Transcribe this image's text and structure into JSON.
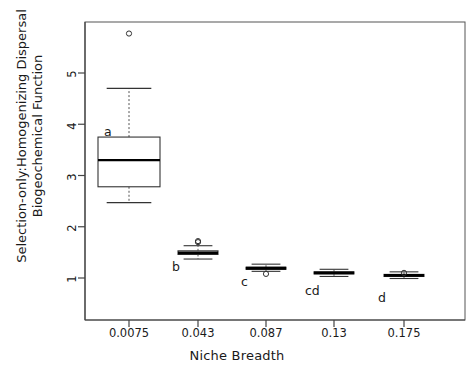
{
  "chart_data": {
    "type": "box",
    "title": "",
    "xlabel": "Niche Breadth",
    "ylabel_line1": "Selection-only:Homogenizing Dispersal",
    "ylabel_line2": "Biogeochemical Function",
    "categories": [
      "0.0075",
      "0.043",
      "0.087",
      "0.13",
      "0.175"
    ],
    "ylim": [
      0.6,
      5.9
    ],
    "yticks": [
      1,
      2,
      3,
      4,
      5
    ],
    "ytick_labels": [
      "1",
      "2",
      "3",
      "4",
      "5"
    ],
    "grid": false,
    "legend": "none",
    "group_letters": [
      "a",
      "b",
      "c",
      "cd",
      "d"
    ],
    "boxes": [
      {
        "category": "0.0075",
        "letter": "a",
        "whisker_low": 2.47,
        "q1": 2.78,
        "median": 3.3,
        "q3": 3.75,
        "whisker_high": 4.7,
        "outliers": [
          5.77
        ]
      },
      {
        "category": "0.043",
        "letter": "b",
        "whisker_low": 1.37,
        "q1": 1.46,
        "median": 1.49,
        "q3": 1.53,
        "whisker_high": 1.63,
        "outliers": [
          1.7,
          1.72
        ]
      },
      {
        "category": "0.087",
        "letter": "c",
        "whisker_low": 1.13,
        "q1": 1.17,
        "median": 1.19,
        "q3": 1.21,
        "whisker_high": 1.27,
        "outliers": [
          1.08
        ]
      },
      {
        "category": "0.13",
        "letter": "cd",
        "whisker_low": 1.03,
        "q1": 1.08,
        "median": 1.1,
        "q3": 1.12,
        "whisker_high": 1.17,
        "outliers": []
      },
      {
        "category": "0.175",
        "letter": "d",
        "whisker_low": 0.99,
        "q1": 1.03,
        "median": 1.05,
        "q3": 1.07,
        "whisker_high": 1.12,
        "outliers": [
          1.1
        ]
      }
    ],
    "colors": {
      "box_line": "#333333",
      "median_line": "#000000",
      "whisker_line": "#555555",
      "outlier_stroke": "#333333",
      "axis": "#444444",
      "text": "#1a1a1a",
      "background": "#ffffff"
    }
  },
  "axes": {
    "y_tick_1": "1",
    "y_tick_2": "2",
    "y_tick_3": "3",
    "y_tick_4": "4",
    "y_tick_5": "5",
    "x_tick_1": "0.0075",
    "x_tick_2": "0.043",
    "x_tick_3": "0.087",
    "x_tick_4": "0.13",
    "x_tick_5": "0.175",
    "x_title": "Niche Breadth",
    "y_title_line1": "Selection-only:Homogenizing Dispersal",
    "y_title_line2": "Biogeochemical Function"
  },
  "annotations": {
    "letter_a": "a",
    "letter_b": "b",
    "letter_c": "c",
    "letter_cd": "cd",
    "letter_d": "d"
  }
}
